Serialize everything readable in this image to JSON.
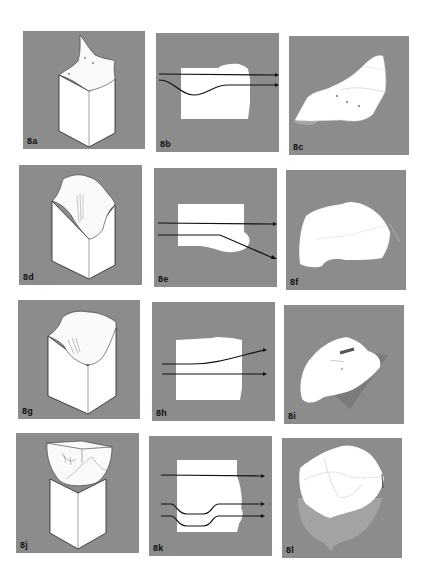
{
  "figure": {
    "background_color": "#ffffff",
    "panel_color": "#8c8c8c",
    "rows": 4,
    "columns": 3,
    "panels": [
      {
        "id": "8a",
        "label": "8a",
        "row": 1,
        "col": 1,
        "type": "isometric-block",
        "description": "rectangular block with peaked folded top"
      },
      {
        "id": "8b",
        "label": "8b",
        "row": 1,
        "col": 2,
        "type": "section-with-arrows",
        "description": "white section with one straight arrow and one curved dipping arrow"
      },
      {
        "id": "8c",
        "label": "8c",
        "row": 1,
        "col": 3,
        "type": "surface-view",
        "description": "unfolded top surface with dotted lines"
      },
      {
        "id": "8d",
        "label": "8d",
        "row": 2,
        "col": 1,
        "type": "isometric-block",
        "description": "block with draped curved top and crease lines"
      },
      {
        "id": "8e",
        "label": "8e",
        "row": 2,
        "col": 2,
        "type": "section-with-arrows",
        "description": "white section with one straight arrow and one bending-down arrow"
      },
      {
        "id": "8f",
        "label": "8f",
        "row": 2,
        "col": 3,
        "type": "surface-view",
        "description": "draped surface with dotted line"
      },
      {
        "id": "8g",
        "label": "8g",
        "row": 3,
        "col": 1,
        "type": "isometric-block",
        "description": "block with cloth-like rounded top"
      },
      {
        "id": "8h",
        "label": "8h",
        "row": 3,
        "col": 2,
        "type": "section-with-arrows",
        "description": "white section with one rising arrow and one straight arrow"
      },
      {
        "id": "8i",
        "label": "8i",
        "row": 3,
        "col": 3,
        "type": "surface-view",
        "description": "rounded surface over tilted plane"
      },
      {
        "id": "8j",
        "label": "8j",
        "row": 4,
        "col": 1,
        "type": "isometric-block",
        "description": "bowl-shaped piece resting on a block"
      },
      {
        "id": "8k",
        "label": "8k",
        "row": 4,
        "col": 2,
        "type": "section-with-arrows",
        "description": "white section with one straight arrow and two stepped arrows"
      },
      {
        "id": "8l",
        "label": "8l",
        "row": 4,
        "col": 3,
        "type": "surface-view",
        "description": "curved shell surface with dotted lines and shadow"
      }
    ]
  }
}
